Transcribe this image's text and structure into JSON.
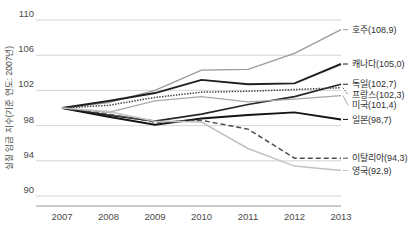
{
  "chart_data": {
    "type": "line",
    "title": "",
    "subtitle": "",
    "xlabel": "",
    "ylabel": "실질 임금 지수(기준 연도: 2007년)",
    "x": [
      2007,
      2008,
      2009,
      2010,
      2011,
      2012,
      2013
    ],
    "x_tick_labels": [
      "2007",
      "2008",
      "2009",
      "2010",
      "2011",
      "2012",
      "2013"
    ],
    "y_tick_labels": [
      "110",
      "106",
      "102",
      "98",
      "94",
      "90"
    ],
    "y_ticks": [
      110,
      106,
      102,
      98,
      94,
      90
    ],
    "ylim": [
      90,
      110
    ],
    "xlim": [
      2007,
      2013
    ],
    "grid": "horizontal",
    "legend_position": "right-inline-end-labels",
    "series": [
      {
        "name": "호주",
        "label": "호주(108,9)",
        "final_value": 108.9,
        "color": "#9a9a9a",
        "style": "solid",
        "width": 1.3,
        "values": [
          100.0,
          100.6,
          102.0,
          104.3,
          104.4,
          106.2,
          108.9
        ]
      },
      {
        "name": "캐나다",
        "label": "캐나다(105,0)",
        "final_value": 105.0,
        "color": "#1f1f1f",
        "style": "solid",
        "width": 1.9,
        "values": [
          100.0,
          100.8,
          101.7,
          103.2,
          102.7,
          102.8,
          105.0
        ]
      },
      {
        "name": "독일",
        "label": "독일(102,7)",
        "final_value": 102.7,
        "color": "#262626",
        "style": "solid",
        "width": 1.7,
        "values": [
          100.0,
          99.2,
          98.5,
          99.3,
          100.4,
          101.3,
          102.7
        ]
      },
      {
        "name": "프랑스",
        "label": "프랑스(102,3)",
        "final_value": 102.3,
        "color": "#3d3d3d",
        "style": "dotted",
        "width": 1.5,
        "values": [
          100.0,
          100.3,
          101.2,
          101.8,
          101.9,
          102.1,
          102.3
        ]
      },
      {
        "name": "미국",
        "label": "미국(101,4)",
        "final_value": 101.4,
        "color": "#a8a8a8",
        "style": "solid",
        "width": 1.2,
        "values": [
          100.0,
          99.5,
          100.8,
          101.3,
          100.7,
          101.0,
          101.4
        ]
      },
      {
        "name": "일본",
        "label": "일본(98,7)",
        "final_value": 98.7,
        "color": "#141414",
        "style": "solid",
        "width": 1.9,
        "values": [
          100.0,
          99.0,
          98.1,
          98.8,
          99.2,
          99.5,
          98.7
        ]
      },
      {
        "name": "이탈리아",
        "label": "이탈리아(94,3)",
        "final_value": 94.3,
        "color": "#4d4d4d",
        "style": "dashed",
        "width": 1.5,
        "values": [
          100.0,
          99.3,
          98.4,
          98.6,
          97.6,
          94.3,
          94.3
        ]
      },
      {
        "name": "영국",
        "label": "영국(92,9)",
        "final_value": 92.9,
        "color": "#c2c2c2",
        "style": "solid",
        "width": 1.5,
        "values": [
          100.0,
          99.6,
          98.5,
          98.4,
          95.4,
          93.4,
          92.9
        ]
      }
    ]
  },
  "colors": {
    "background": "#ffffff",
    "gridline": "#c9c9c9",
    "axis": "#8a8a8a",
    "text": "#3a3a3a"
  }
}
